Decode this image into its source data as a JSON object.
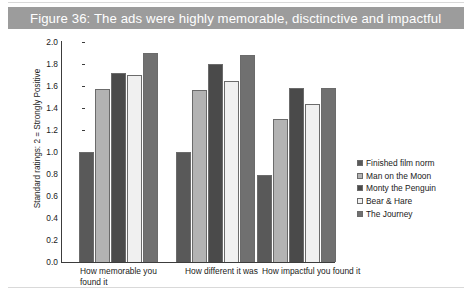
{
  "figure": {
    "title": "Figure 36: The ads were highly memorable, disctinctive and impactful",
    "banner_color": "#9c9c9c",
    "title_color": "#ffffff"
  },
  "chart_data": {
    "type": "bar",
    "title": "Figure 36: The ads were highly memorable, disctinctive and impactful",
    "xlabel": "",
    "ylabel": "Standard ratings: 2 = Strongly Positive",
    "ylim": [
      0,
      2.0
    ],
    "ytick_step": 0.2,
    "yticks": [
      "2.0",
      "1.8",
      "1.6",
      "1.4",
      "1.2",
      "1.0",
      "0.8",
      "0.6",
      "0.4",
      "0.2",
      "0.0"
    ],
    "grid": false,
    "legend_position": "right",
    "categories": [
      "How memorable you found it",
      "How different it was",
      "How impactful you found it"
    ],
    "series": [
      {
        "name": "Finished film norm",
        "color": "#595959",
        "values": [
          1.0,
          1.0,
          0.79
        ]
      },
      {
        "name": "Man on the Moon",
        "color": "#b3b3b3",
        "values": [
          1.57,
          1.56,
          1.3
        ]
      },
      {
        "name": "Monty the Penguin",
        "color": "#4a4a4a",
        "values": [
          1.72,
          1.8,
          1.58
        ]
      },
      {
        "name": "Bear & Hare",
        "color": "#f0f0f0",
        "values": [
          1.7,
          1.65,
          1.44
        ]
      },
      {
        "name": "The Journey",
        "color": "#707070",
        "values": [
          1.9,
          1.88,
          1.58
        ]
      }
    ]
  }
}
